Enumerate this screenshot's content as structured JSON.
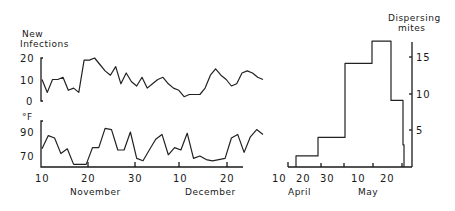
{
  "chart_data": [
    {
      "type": "line",
      "title": "",
      "ylabel": "New Infections",
      "xlabel": "",
      "ylim": [
        0,
        20
      ],
      "yticks": [
        "20",
        "10",
        "0"
      ],
      "x_ticks": [
        "10",
        "20",
        "30",
        "10",
        "20"
      ],
      "x_month_labels": [
        "November",
        "December"
      ],
      "x_day_offsets": [
        0,
        1,
        2,
        3,
        4,
        5,
        6,
        7,
        8,
        9,
        10,
        11,
        12,
        13,
        14,
        15,
        16,
        17,
        18,
        19,
        20,
        21,
        22,
        23,
        24,
        25,
        26,
        27,
        28,
        29,
        30,
        31,
        32,
        33,
        34,
        35,
        36,
        37,
        38,
        39,
        40,
        41,
        42,
        43,
        44,
        45,
        46,
        47,
        48
      ],
      "series": [
        {
          "name": "New Infections",
          "values": [
            10,
            4,
            10,
            10,
            11,
            5,
            6,
            4,
            19,
            19,
            20,
            17,
            14,
            12,
            16,
            8,
            13,
            9,
            7,
            11,
            6,
            8,
            10,
            11,
            8,
            6,
            5,
            2,
            3,
            3,
            3,
            6,
            12,
            15,
            12,
            10,
            7,
            8,
            13,
            14,
            13,
            11,
            10
          ]
        }
      ]
    },
    {
      "type": "line",
      "title": "",
      "ylabel": "°F",
      "xlabel": "",
      "ylim": [
        62,
        95
      ],
      "yticks": [
        "90",
        "70"
      ],
      "x_ticks": [
        "10",
        "20",
        "30",
        "10",
        "20"
      ],
      "x_month_labels": [
        "November",
        "December"
      ],
      "series": [
        {
          "name": "Temperature (°F)",
          "values": [
            76,
            87,
            85,
            72,
            76,
            63,
            63,
            63,
            77,
            77,
            93,
            92,
            75,
            75,
            90,
            68,
            66,
            75,
            84,
            88,
            71,
            77,
            75,
            89,
            68,
            70,
            67,
            66,
            67,
            68,
            85,
            88,
            73,
            86,
            92,
            88
          ]
        }
      ]
    },
    {
      "type": "bar",
      "title": "",
      "ylabel": "Dispersing mites",
      "xlabel": "",
      "ylim": [
        0,
        17
      ],
      "yticks": [
        "15",
        "10",
        "5"
      ],
      "x_ticks": [
        "10",
        "20",
        "30",
        "10",
        "20"
      ],
      "x_month_labels": [
        "April",
        "May"
      ],
      "categories": [
        "Apr 13-20",
        "Apr 20-30",
        "Apr 30-May 7",
        "May 7-14",
        "May 14-21",
        "May 21-28"
      ],
      "values": [
        1.5,
        4,
        14,
        17,
        9,
        3
      ]
    }
  ],
  "labels": {
    "infections_title_1": "New",
    "infections_title_2": "Infections",
    "temp_unit": "°F",
    "mites_title_1": "Dispersing",
    "mites_title_2": "mites",
    "month_nov": "November",
    "month_dec": "December",
    "month_apr": "April",
    "month_may": "May",
    "y_inf_20": "20",
    "y_inf_10": "10",
    "y_inf_0": "0",
    "y_temp_90": "90",
    "y_temp_70": "70",
    "y_mites_15": "15",
    "y_mites_10": "10",
    "y_mites_5": "5",
    "x_left_1": "10",
    "x_left_2": "20",
    "x_left_3": "30",
    "x_left_4": "10",
    "x_left_5": "20",
    "x_right_1": "10",
    "x_right_2": "20",
    "x_right_3": "30",
    "x_right_4": "10",
    "x_right_5": "20"
  }
}
